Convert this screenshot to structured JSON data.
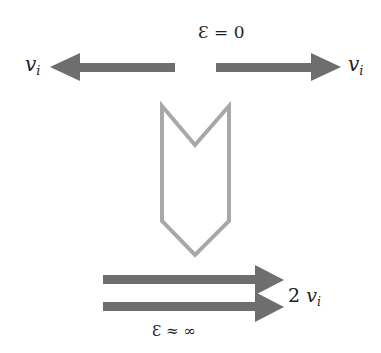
{
  "diagram": {
    "top": {
      "energy_label": "Ɛ = 0",
      "left_label": "v",
      "left_label_sub": "i",
      "right_label": "v",
      "right_label_sub": "i",
      "arrow_color": "#6e6e6e"
    },
    "transition": {
      "shape": "chevron-down-outline",
      "stroke_color": "#a8a8a8"
    },
    "bottom": {
      "energy_label": "Ɛ ≈ ∞",
      "velocity_coeff": "2",
      "velocity_var": "v",
      "velocity_sub": "i",
      "arrow_color": "#6e6e6e"
    }
  }
}
